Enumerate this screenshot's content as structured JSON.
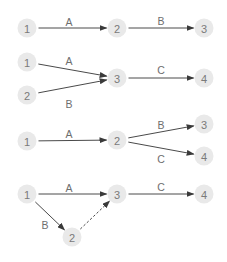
{
  "colors": {
    "node_fill": "#e9e9e9",
    "node_text": "#7a7a7a",
    "edge": "#4a4a4a",
    "edge_label": "#6e6e6e"
  },
  "diagrams": [
    {
      "nodes": [
        {
          "id": "1",
          "x": 27,
          "y": 28
        },
        {
          "id": "2",
          "x": 117,
          "y": 28
        },
        {
          "id": "3",
          "x": 204,
          "y": 28
        }
      ],
      "edges": [
        {
          "from": 0,
          "to": 1,
          "label": "A",
          "lx": 69,
          "ly": 22,
          "dashed": false
        },
        {
          "from": 1,
          "to": 2,
          "label": "B",
          "lx": 161,
          "ly": 21,
          "dashed": false
        }
      ]
    },
    {
      "nodes": [
        {
          "id": "1",
          "x": 27,
          "y": 62
        },
        {
          "id": "2",
          "x": 27,
          "y": 95
        },
        {
          "id": "3",
          "x": 117,
          "y": 78
        },
        {
          "id": "4",
          "x": 204,
          "y": 78
        }
      ],
      "edges": [
        {
          "from": 0,
          "to": 2,
          "label": "A",
          "lx": 69,
          "ly": 61,
          "dashed": false
        },
        {
          "from": 1,
          "to": 2,
          "label": "B",
          "lx": 69,
          "ly": 104,
          "dashed": false
        },
        {
          "from": 2,
          "to": 3,
          "label": "C",
          "lx": 161,
          "ly": 70,
          "dashed": false
        }
      ]
    },
    {
      "nodes": [
        {
          "id": "1",
          "x": 27,
          "y": 141
        },
        {
          "id": "2",
          "x": 117,
          "y": 140
        },
        {
          "id": "3",
          "x": 204,
          "y": 124
        },
        {
          "id": "4",
          "x": 204,
          "y": 156
        }
      ],
      "edges": [
        {
          "from": 0,
          "to": 1,
          "label": "A",
          "lx": 69,
          "ly": 134,
          "dashed": false
        },
        {
          "from": 1,
          "to": 2,
          "label": "B",
          "lx": 161,
          "ly": 125,
          "dashed": false
        },
        {
          "from": 1,
          "to": 3,
          "label": "C",
          "lx": 161,
          "ly": 159,
          "dashed": false
        }
      ]
    },
    {
      "nodes": [
        {
          "id": "1",
          "x": 27,
          "y": 194
        },
        {
          "id": "3",
          "x": 117,
          "y": 194
        },
        {
          "id": "4",
          "x": 204,
          "y": 194
        },
        {
          "id": "2",
          "x": 72,
          "y": 237
        }
      ],
      "edges": [
        {
          "from": 0,
          "to": 1,
          "label": "A",
          "lx": 69,
          "ly": 188,
          "dashed": false
        },
        {
          "from": 1,
          "to": 2,
          "label": "C",
          "lx": 161,
          "ly": 187,
          "dashed": false
        },
        {
          "from": 0,
          "to": 3,
          "label": "B",
          "lx": 45,
          "ly": 225,
          "dashed": false
        },
        {
          "from": 3,
          "to": 1,
          "label": "",
          "lx": 0,
          "ly": 0,
          "dashed": true
        }
      ]
    }
  ]
}
